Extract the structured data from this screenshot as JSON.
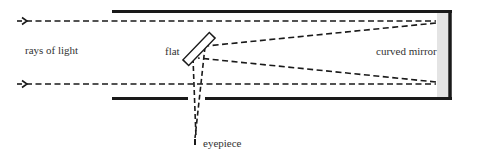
{
  "diagram": {
    "labels": {
      "rays": "rays of light",
      "flat": "flat",
      "mirror": "curved mirror",
      "eyepiece": "eyepiece"
    },
    "colors": {
      "line": "#1a1a1a",
      "mirror_fill": "#e4e4e4",
      "text": "#333333",
      "background": "#ffffff"
    }
  }
}
